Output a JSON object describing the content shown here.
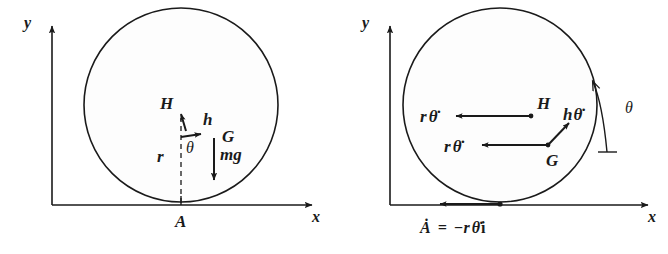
{
  "figure": {
    "panels": [
      {
        "id": "left",
        "name": "force-diagram",
        "axes": {
          "x_label": "x",
          "y_label": "y"
        },
        "labels": {
          "contact_point": "A",
          "radius": "r",
          "height": "h",
          "angle": "θ",
          "point_H": "H",
          "point_G": "G",
          "weight": "mg"
        }
      },
      {
        "id": "right",
        "name": "velocity-diagram",
        "axes": {
          "x_label": "x",
          "y_label": "y"
        },
        "labels": {
          "point_H": "H",
          "point_G": "G",
          "angle": "θ",
          "vel_H_r": "r",
          "vel_H_thetadot": "θ̇",
          "vel_G_r": "r",
          "vel_G_thetadot": "θ̇",
          "vel_h_h": "h",
          "vel_h_thetadot": "θ̇",
          "contact_velocity": "Ȧ = −r θ̇ i",
          "contact_velocity_A": "Ȧ",
          "contact_velocity_eq": "=",
          "contact_velocity_rhs": "−r",
          "contact_velocity_thetadot": "θ̇",
          "contact_velocity_i": "i"
        }
      }
    ],
    "colors": {
      "ink": "#1a1a1a",
      "background": "#ffffff",
      "disk_fill": "#fdfdfd"
    }
  }
}
